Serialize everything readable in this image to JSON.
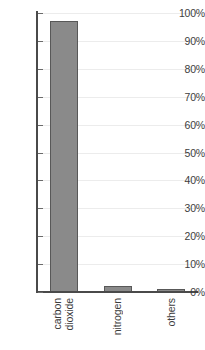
{
  "chart_data": {
    "type": "bar",
    "title": "",
    "subtitle": "",
    "xlabel": "",
    "ylabel": "",
    "categories": [
      "carbon dioxide",
      "nitrogen",
      "others"
    ],
    "category_lines": [
      [
        "carbon",
        "dioxide"
      ],
      [
        "nitrogen"
      ],
      [
        "others"
      ]
    ],
    "values": [
      97,
      2,
      1
    ],
    "ylim": [
      0,
      100
    ],
    "ytick_values": [
      0,
      10,
      20,
      30,
      40,
      50,
      60,
      70,
      80,
      90,
      100
    ],
    "ytick_labels": [
      "0%",
      "10%",
      "20%",
      "30%",
      "40%",
      "50%",
      "60%",
      "70%",
      "80%",
      "90%",
      "100%"
    ],
    "grid": "horizontal",
    "legend": "none",
    "value_suffix": "%",
    "bar_fill_color": "#8a8a8a",
    "bar_border_color": "#585858",
    "gridline_color": "#ececec",
    "axis_color": "#4a4a4a",
    "label_rotation": 90
  }
}
